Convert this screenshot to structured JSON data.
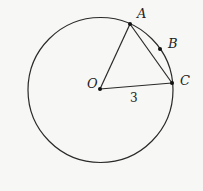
{
  "diagram": {
    "type": "geometry",
    "circle": {
      "cx": 100.5,
      "cy": 90,
      "r": 72.5,
      "stroke": "#2a2a2a"
    },
    "points": {
      "O": {
        "label": "O",
        "x": 100,
        "y": 89,
        "lx": 87,
        "ly": 88
      },
      "A": {
        "label": "A",
        "x": 130,
        "y": 24,
        "lx": 137,
        "ly": 18
      },
      "B": {
        "label": "B",
        "x": 160,
        "y": 49,
        "lx": 168,
        "ly": 48
      },
      "C": {
        "label": "C",
        "x": 172,
        "y": 83,
        "lx": 180,
        "ly": 85
      }
    },
    "segments": [
      [
        "O",
        "A"
      ],
      [
        "O",
        "C"
      ],
      [
        "A",
        "C"
      ]
    ],
    "measurements": [
      {
        "segment": "OC",
        "value": "3",
        "x": 133,
        "y": 102
      }
    ]
  }
}
